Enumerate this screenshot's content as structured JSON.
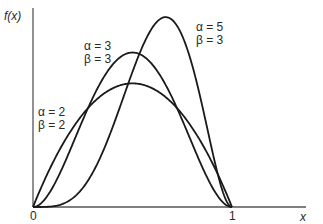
{
  "chart_data": {
    "type": "line",
    "title": "",
    "xlabel": "x",
    "ylabel": "f(x)",
    "xlim": [
      0,
      1
    ],
    "ylim": [
      0,
      2.35
    ],
    "x_ticks": [
      "0",
      "1"
    ],
    "grid": false,
    "legend": "inline annotations",
    "series": [
      {
        "name": "α = 2, β = 2",
        "alpha": 2,
        "beta": 2,
        "label_line1": "α = 2",
        "label_line2": "β = 2",
        "peak_x": 0.5,
        "peak_y": 1.5
      },
      {
        "name": "α = 3, β = 3",
        "alpha": 3,
        "beta": 3,
        "label_line1": "α = 3",
        "label_line2": "β = 3",
        "peak_x": 0.5,
        "peak_y": 1.875
      },
      {
        "name": "α = 5, β = 3",
        "alpha": 5,
        "beta": 3,
        "label_line1": "α = 5",
        "label_line2": "β = 3",
        "peak_x": 0.667,
        "peak_y": 2.305
      }
    ]
  },
  "labels": {
    "y_axis": "f(x)",
    "x_axis": "x",
    "origin": "0",
    "x_one": "1"
  },
  "colors": {
    "curve": "#1a1a1a",
    "axis": "#555555"
  }
}
